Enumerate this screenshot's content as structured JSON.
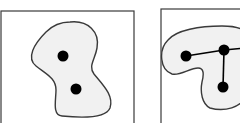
{
  "figure": {
    "background": "#ffffff",
    "stroke_color": "#3a3a3a",
    "fill_color": "#f1f1f1",
    "node_color": "#000000",
    "panels": [
      {
        "id": "left",
        "frame": {
          "x": 1,
          "y": 11,
          "w": 133,
          "h": 120
        },
        "region_path": "M 70 22 C 88 20, 100 32, 97 48 C 95 60, 88 66, 94 74 C 104 86, 114 96, 110 108 C 106 118, 82 118, 62 116 C 52 115, 56 100, 56 90 C 56 78, 46 74, 36 66 C 26 58, 34 44, 46 32 C 54 24, 62 22, 70 22 Z",
        "nodes": [
          {
            "cx": 63,
            "cy": 56,
            "r": 5.5
          },
          {
            "cx": 76,
            "cy": 89,
            "r": 5.5
          }
        ],
        "edges": []
      },
      {
        "id": "right",
        "frame": {
          "x": 161,
          "y": 9,
          "w": 90,
          "h": 120
        },
        "region_path": "M 168 40 C 176 30, 200 26, 222 26 C 236 26, 244 28, 246 34 L 246 95 C 242 108, 224 112, 210 108 C 202 104, 200 92, 202 82 C 204 74, 204 68, 198 68 C 190 68, 180 76, 172 74 C 160 70, 158 50, 168 40 Z",
        "nodes": [
          {
            "cx": 186,
            "cy": 56,
            "r": 5.5
          },
          {
            "cx": 224,
            "cy": 50,
            "r": 5.5
          },
          {
            "cx": 223,
            "cy": 87,
            "r": 5.5
          }
        ],
        "edges": [
          {
            "from": 0,
            "to": 1
          },
          {
            "from": 1,
            "to": 2
          },
          {
            "from": 1,
            "to_x": 246,
            "to_y": 48
          }
        ]
      }
    ]
  }
}
